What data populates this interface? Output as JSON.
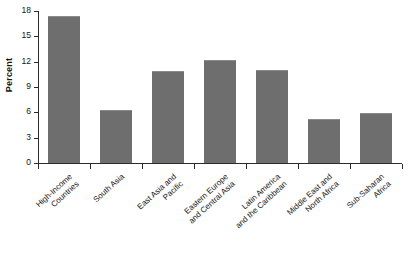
{
  "chart_data": {
    "type": "bar",
    "title": "",
    "xlabel": "",
    "ylabel": "Percent",
    "ylim": [
      0,
      18
    ],
    "yticks": [
      0,
      3,
      6,
      9,
      12,
      15,
      18
    ],
    "ytick_labels": [
      "0",
      "3",
      "6",
      "9",
      "12",
      "15",
      "18"
    ],
    "grid": false,
    "legend": "none",
    "bar_color": "#6e6e6e",
    "categories": [
      "High-Income Countries",
      "South Asia",
      "East Asia and Pacific",
      "Eastern Europe and Central Asia",
      "Latin America and the Caribbean",
      "Middle East and North Africa",
      "Sub-Saharan Africa"
    ],
    "category_lines": [
      [
        "High-Income",
        "Countries"
      ],
      [
        "South Asia"
      ],
      [
        "East Asia and",
        "Pacific"
      ],
      [
        "Eastern Europe",
        "and Central Asia"
      ],
      [
        "Latin America",
        "and the Caribbean"
      ],
      [
        "Middle East and",
        "North Africa"
      ],
      [
        "Sub-Saharan",
        "Africa"
      ]
    ],
    "values": [
      17.4,
      6.3,
      10.9,
      12.2,
      11.0,
      5.2,
      5.9
    ]
  }
}
